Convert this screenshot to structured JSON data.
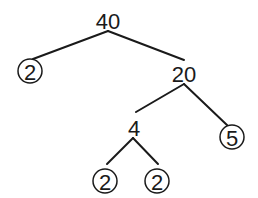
{
  "diagram": {
    "type": "factor-tree",
    "root": "40",
    "nodes": [
      {
        "id": "n40",
        "value": "40",
        "prime": false,
        "x": 108,
        "y": 20
      },
      {
        "id": "n2a",
        "value": "2",
        "prime": true,
        "x": 30,
        "y": 71
      },
      {
        "id": "n20",
        "value": "20",
        "prime": false,
        "x": 184,
        "y": 73
      },
      {
        "id": "n4",
        "value": "4",
        "prime": false,
        "x": 134,
        "y": 127
      },
      {
        "id": "n5",
        "value": "5",
        "prime": true,
        "x": 232,
        "y": 137
      },
      {
        "id": "n2b",
        "value": "2",
        "prime": true,
        "x": 105,
        "y": 181
      },
      {
        "id": "n2c",
        "value": "2",
        "prime": true,
        "x": 157,
        "y": 181
      }
    ],
    "edges": [
      {
        "from": "n40",
        "to": "n2a",
        "x1": 108,
        "y1": 31,
        "x2": 33,
        "y2": 59
      },
      {
        "from": "n40",
        "to": "n20",
        "x1": 108,
        "y1": 31,
        "x2": 184,
        "y2": 60
      },
      {
        "from": "n20",
        "to": "n4",
        "x1": 184,
        "y1": 84,
        "x2": 136,
        "y2": 112
      },
      {
        "from": "n20",
        "to": "n5",
        "x1": 184,
        "y1": 84,
        "x2": 228,
        "y2": 126
      },
      {
        "from": "n4",
        "to": "n2b",
        "x1": 133,
        "y1": 138,
        "x2": 107,
        "y2": 164
      },
      {
        "from": "n4",
        "to": "n2c",
        "x1": 133,
        "y1": 138,
        "x2": 158,
        "y2": 164
      }
    ],
    "circle_radius": 12
  }
}
